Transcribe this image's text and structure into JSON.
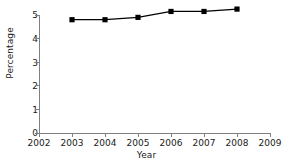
{
  "chart_data": {
    "type": "line",
    "title": "",
    "xlabel": "Year",
    "ylabel": "Percentage",
    "x": [
      2003,
      2004,
      2005,
      2006,
      2007,
      2008
    ],
    "values": [
      4.8,
      4.8,
      4.9,
      5.15,
      5.15,
      5.25
    ],
    "series": [
      {
        "name": "Percentage",
        "values": [
          4.8,
          4.8,
          4.9,
          5.15,
          5.15,
          5.25
        ]
      }
    ],
    "xlim": [
      2002,
      2009
    ],
    "ylim": [
      0,
      5
    ],
    "xticks": [
      2002,
      2003,
      2004,
      2005,
      2006,
      2007,
      2008,
      2009
    ],
    "xtick_labels": [
      "2002",
      "2003",
      "2004",
      "2005",
      "2006",
      "2007",
      "2008",
      "2009"
    ],
    "yticks": [
      0,
      1,
      2,
      3,
      4,
      5
    ],
    "ytick_labels": [
      "0",
      "1",
      "2",
      "3",
      "4",
      "5"
    ],
    "grid": false,
    "legend": "none",
    "marker": "square",
    "line_color": "#000000",
    "marker_color": "#000000",
    "axis_color": "#808080",
    "background_color": "#ffffff"
  }
}
